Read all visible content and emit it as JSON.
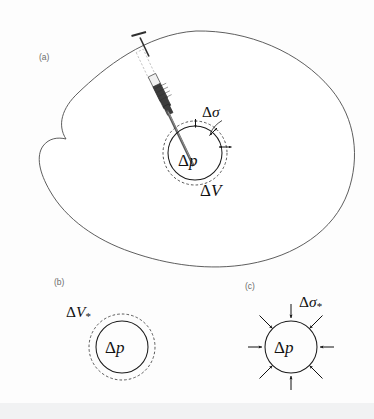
{
  "figure": {
    "background_color": "#fdfdfd",
    "ink_color": "#111111",
    "outline_color": "#4c4c4c",
    "panels": [
      {
        "id": "a",
        "tag": "(a)",
        "description": "Syringe injecting into an inclusion inside a large irregular body",
        "labels": {
          "delta_sigma": "Δσ",
          "delta_p": "Δp",
          "delta_V": "ΔV"
        }
      },
      {
        "id": "b",
        "tag": "(b)",
        "description": "Free inclusion with volume change, dashed outer circle",
        "labels": {
          "delta_V_star": "ΔV",
          "delta_V_star_sub": "*",
          "delta_p": "Δp"
        }
      },
      {
        "id": "c",
        "tag": "(c)",
        "description": "Inclusion under uniform inward traction arrows",
        "labels": {
          "delta_sigma_star": "Δσ",
          "delta_sigma_star_sub": "*",
          "delta_p": "Δp"
        }
      }
    ],
    "symbols": {
      "delta": "Δ",
      "sigma": "σ",
      "p": "p",
      "V": "V",
      "star": "*"
    },
    "geometry": {
      "panel_a": {
        "inner_circle": {
          "cx": 195,
          "cy": 153,
          "r": 27
        },
        "outer_dashed_circle": {
          "cx": 195,
          "cy": 153,
          "r": 32
        },
        "gap_arrows": 3
      },
      "panel_b": {
        "inner_circle": {
          "cx": 122,
          "cy": 347,
          "r": 26
        },
        "outer_dashed_circle": {
          "cx": 122,
          "cy": 347,
          "r": 33
        }
      },
      "panel_c": {
        "circle": {
          "cx": 291,
          "cy": 347,
          "r": 26
        },
        "arrow_count": 8,
        "arrow_angle_step_deg": 45
      }
    }
  }
}
